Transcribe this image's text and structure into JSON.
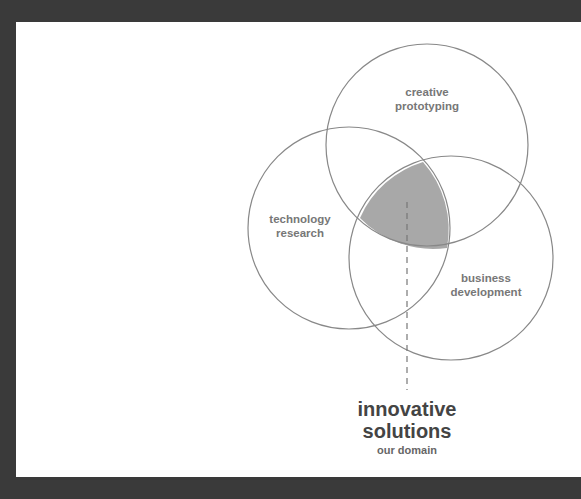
{
  "diagram": {
    "type": "venn",
    "colors": {
      "frame": "#3a3a3a",
      "background": "#ffffff",
      "stroke": "#888888",
      "intersection_fill": "#a8a8a8",
      "label": "#777777",
      "title": "#444444",
      "subtitle": "#666666"
    },
    "circles": [
      {
        "label_line1": "creative",
        "label_line2": "prototyping"
      },
      {
        "label_line1": "technology",
        "label_line2": "research"
      },
      {
        "label_line1": "business",
        "label_line2": "development"
      }
    ],
    "intersection": {
      "title_line1": "innovative",
      "title_line2": "solutions",
      "subtitle": "our domain"
    }
  }
}
